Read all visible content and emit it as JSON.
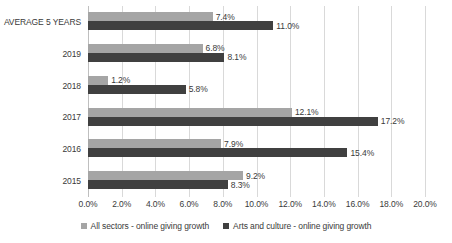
{
  "chart_data": {
    "type": "bar",
    "orientation": "horizontal",
    "title": "",
    "subtitle": "",
    "xlabel": "",
    "ylabel": "",
    "xlim": [
      0,
      20
    ],
    "xtick_step": 2,
    "xtick_labels": [
      "0.0%",
      "2.0%",
      "4.0%",
      "6.0%",
      "8.0%",
      "10.0%",
      "12.0%",
      "14.0%",
      "16.0%",
      "18.0%",
      "20.0%"
    ],
    "xtick_values": [
      0,
      2,
      4,
      6,
      8,
      10,
      12,
      14,
      16,
      18,
      20
    ],
    "grid": "vertical",
    "legend_position": "bottom",
    "categories": [
      "AVERAGE 5 YEARS",
      "2019",
      "2018",
      "2017",
      "2016",
      "2015"
    ],
    "series": [
      {
        "name": "All sectors - online giving growth",
        "color": "#A5A5A5",
        "values": [
          7.4,
          6.8,
          1.2,
          12.1,
          7.9,
          9.2
        ],
        "labels": [
          "7.4%",
          "6.8%",
          "1.2%",
          "12.1%",
          "7.9%",
          "9.2%"
        ]
      },
      {
        "name": "Arts and culture - online giving growth",
        "color": "#404040",
        "values": [
          11.0,
          8.1,
          5.8,
          17.2,
          15.4,
          8.3
        ],
        "labels": [
          "11.0%",
          "8.1%",
          "5.8%",
          "17.2%",
          "15.4%",
          "8.3%"
        ]
      }
    ]
  },
  "colors": {
    "series_all_sectors": "#A5A5A5",
    "series_arts_culture": "#404040",
    "gridline": "#D9D9D9",
    "axis": "#BFBFBF",
    "text": "#3A3A3A",
    "background": "#FFFFFF"
  }
}
